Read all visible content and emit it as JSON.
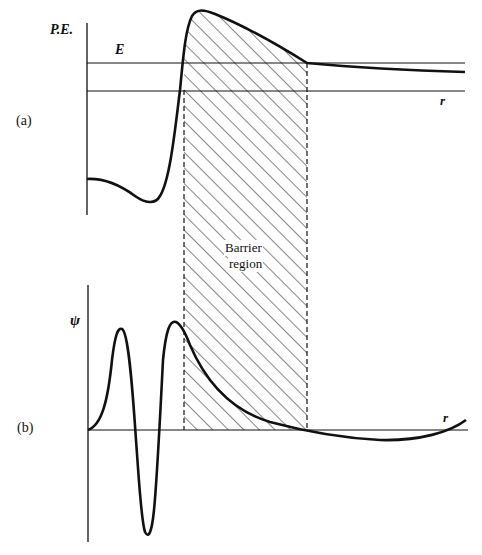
{
  "figure": {
    "panel_a": {
      "label": "(a)",
      "y_axis_label": "P.E.",
      "energy_label": "E",
      "x_axis_label": "r"
    },
    "panel_b": {
      "label": "(b)",
      "y_axis_label": "ψ",
      "x_axis_label": "r"
    },
    "barrier": {
      "label_line1": "Barrier",
      "label_line2": "region"
    }
  },
  "colors": {
    "ink": "#111111",
    "background": "#ffffff"
  }
}
